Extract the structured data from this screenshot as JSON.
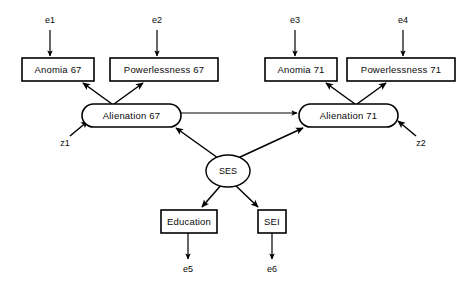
{
  "diagram": {
    "type": "path-diagram",
    "background_color": "#ffffff",
    "stroke_color": "#000000"
  },
  "observed_variables": [
    {
      "id": "anomia67",
      "label": "Anomia  67",
      "shape": "rectangle"
    },
    {
      "id": "powerlessness67",
      "label": "Powerlessness  67",
      "shape": "rectangle"
    },
    {
      "id": "anomia71",
      "label": "Anomia  71",
      "shape": "rectangle"
    },
    {
      "id": "powerlessness71",
      "label": "Powerlessness  71",
      "shape": "rectangle"
    },
    {
      "id": "education",
      "label": "Education",
      "shape": "rectangle"
    },
    {
      "id": "sei",
      "label": "SEI",
      "shape": "rectangle"
    }
  ],
  "latent_variables": [
    {
      "id": "alienation67",
      "label": "Alienation  67",
      "shape": "rounded-rectangle"
    },
    {
      "id": "alienation71",
      "label": "Alienation  71",
      "shape": "rounded-rectangle"
    },
    {
      "id": "ses",
      "label": "SES",
      "shape": "ellipse"
    }
  ],
  "error_terms": [
    {
      "id": "e1",
      "label": "e1",
      "target": "anomia67"
    },
    {
      "id": "e2",
      "label": "e2",
      "target": "powerlessness67"
    },
    {
      "id": "e3",
      "label": "e3",
      "target": "anomia71"
    },
    {
      "id": "e4",
      "label": "e4",
      "target": "powerlessness71"
    },
    {
      "id": "e5",
      "label": "e5",
      "source": "education"
    },
    {
      "id": "e6",
      "label": "e6",
      "source": "sei"
    }
  ],
  "disturbance_terms": [
    {
      "id": "z1",
      "label": "z1",
      "target": "alienation67"
    },
    {
      "id": "z2",
      "label": "z2",
      "target": "alienation71"
    }
  ],
  "paths": [
    {
      "from": "e1",
      "to": "anomia67",
      "kind": "error"
    },
    {
      "from": "e2",
      "to": "powerlessness67",
      "kind": "error"
    },
    {
      "from": "e3",
      "to": "anomia71",
      "kind": "error"
    },
    {
      "from": "e4",
      "to": "powerlessness71",
      "kind": "error"
    },
    {
      "from": "alienation67",
      "to": "anomia67",
      "kind": "loading"
    },
    {
      "from": "alienation67",
      "to": "powerlessness67",
      "kind": "loading"
    },
    {
      "from": "alienation71",
      "to": "anomia71",
      "kind": "loading"
    },
    {
      "from": "alienation71",
      "to": "powerlessness71",
      "kind": "loading"
    },
    {
      "from": "z1",
      "to": "alienation67",
      "kind": "disturbance"
    },
    {
      "from": "z2",
      "to": "alienation71",
      "kind": "disturbance"
    },
    {
      "from": "alienation67",
      "to": "alienation71",
      "kind": "structural"
    },
    {
      "from": "ses",
      "to": "alienation67",
      "kind": "structural"
    },
    {
      "from": "ses",
      "to": "alienation71",
      "kind": "structural"
    },
    {
      "from": "ses",
      "to": "education",
      "kind": "loading"
    },
    {
      "from": "ses",
      "to": "sei",
      "kind": "loading"
    },
    {
      "from": "education",
      "to": "e5",
      "kind": "error"
    },
    {
      "from": "sei",
      "to": "e6",
      "kind": "error"
    }
  ]
}
